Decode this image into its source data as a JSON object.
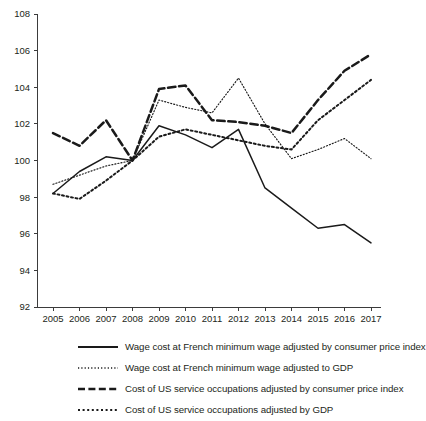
{
  "chart_data": {
    "type": "line",
    "title": "",
    "xlabel": "",
    "ylabel": "",
    "categories": [
      "2005",
      "2006",
      "2007",
      "2008",
      "2009",
      "2010",
      "2011",
      "2012",
      "2013",
      "2014",
      "2015",
      "2016",
      "2017"
    ],
    "x": [
      2005,
      2006,
      2007,
      2008,
      2009,
      2010,
      2011,
      2012,
      2013,
      2014,
      2015,
      2016,
      2017
    ],
    "xlim": [
      2005,
      2017
    ],
    "ylim": [
      92,
      108
    ],
    "yticks": [
      92,
      94,
      96,
      98,
      100,
      102,
      104,
      106,
      108
    ],
    "xticks": [
      "2005",
      "2006",
      "2007",
      "2008",
      "2009",
      "2010",
      "2011",
      "2012",
      "2013",
      "2014",
      "2015",
      "2016",
      "2017"
    ],
    "grid": false,
    "legend_position": "bottom",
    "series": [
      {
        "name": "Wage cost at French minimum wage adjusted by consumer price index",
        "style": "solid",
        "color": "#1a1a1a",
        "values": [
          98.2,
          99.4,
          100.2,
          100.0,
          101.9,
          101.4,
          100.7,
          101.7,
          98.5,
          97.4,
          96.3,
          96.5,
          95.5
        ]
      },
      {
        "name": "Wage cost at French minimum wage adjusted to GDP",
        "style": "fine-dotted",
        "color": "#1a1a1a",
        "values": [
          98.7,
          99.2,
          99.7,
          100.0,
          103.3,
          102.9,
          102.6,
          104.5,
          102.0,
          100.1,
          100.6,
          101.2,
          100.1
        ]
      },
      {
        "name": "Cost of US service occupations adjusted by consumer price index",
        "style": "heavy-dashed",
        "color": "#1a1a1a",
        "values": [
          101.5,
          100.8,
          102.2,
          100.0,
          103.9,
          104.1,
          102.2,
          102.1,
          101.9,
          101.5,
          103.3,
          104.9,
          105.8
        ]
      },
      {
        "name": "Cost of US service occupations adjusted by GDP",
        "style": "dotted",
        "color": "#1a1a1a",
        "values": [
          98.2,
          97.9,
          98.9,
          100.0,
          101.3,
          101.7,
          101.4,
          101.1,
          100.8,
          100.6,
          102.2,
          103.3,
          104.4
        ]
      }
    ]
  },
  "legend": {
    "items": [
      {
        "label": "Wage cost at French minimum wage adjusted by consumer price index",
        "style": "solid"
      },
      {
        "label": "Wage cost at French minimum wage adjusted to GDP",
        "style": "fine-dotted"
      },
      {
        "label": "Cost of US service occupations adjusted by consumer price index",
        "style": "heavy-dashed"
      },
      {
        "label": "Cost of US service occupations adjusted by GDP",
        "style": "dotted"
      }
    ]
  }
}
